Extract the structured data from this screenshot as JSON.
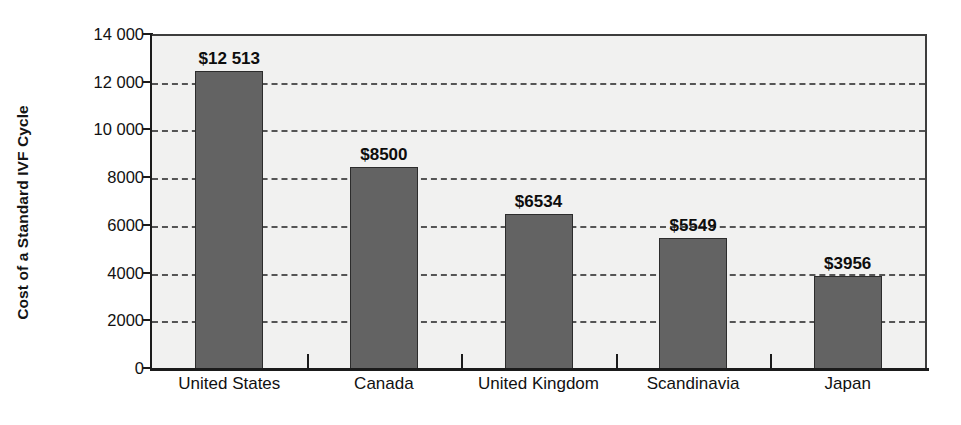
{
  "chart_data": {
    "type": "bar",
    "title": "",
    "subtitle": "",
    "xlabel": "",
    "ylabel": "Cost of a Standard IVF Cycle",
    "categories": [
      "United States",
      "Canada",
      "United Kingdom",
      "Scandinavia",
      "Japan"
    ],
    "values": [
      12513,
      8500,
      6534,
      5549,
      3956
    ],
    "data_labels": [
      "$12 513",
      "$8500",
      "$6534",
      "$5549",
      "$3956"
    ],
    "ylim": [
      0,
      14000
    ],
    "ytick_values": [
      0,
      2000,
      4000,
      6000,
      8000,
      10000,
      12000,
      14000
    ],
    "ytick_labels": [
      "0",
      "2000",
      "4000",
      "6000",
      "8000",
      "10 000",
      "12 000",
      "14 000"
    ],
    "grid": "horizontal-dashed",
    "legend": "none",
    "colors": {
      "bar_fill": "#636363",
      "bar_border": "#2c2c2c",
      "plot_background": "#f1f1f0",
      "page_background": "#ffffff",
      "axis": "#1b1b1b",
      "gridline": "#555555",
      "text": "#111111"
    }
  }
}
